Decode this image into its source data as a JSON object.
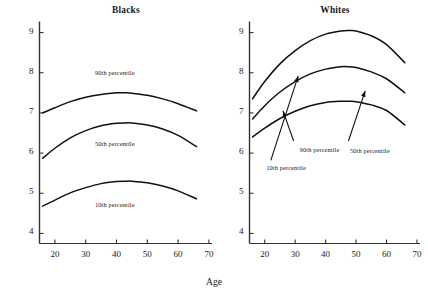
{
  "figure": {
    "xlabel": "Age",
    "ylabel": "Logarithm of regular-sector monthly earnings"
  },
  "chart_data": {
    "type": "line",
    "xlabel": "Age",
    "ylabel": "Logarithm of regular-sector monthly earnings",
    "xlim": [
      15,
      71
    ],
    "ylim": [
      3.75,
      9.25
    ],
    "xticks": [
      20,
      30,
      40,
      50,
      60,
      70
    ],
    "yticks": [
      4,
      5,
      6,
      7,
      8,
      9
    ],
    "grid": false,
    "legend": "inline-annotations",
    "panels": [
      {
        "name": "blacks",
        "title": "Blacks",
        "series": [
          {
            "name": "90th percentile",
            "label": "90th percentile",
            "label_x": 33,
            "label_y": 8.0,
            "arrow": false,
            "x": [
              16,
              20,
              25,
              30,
              35,
              40,
              43,
              45,
              50,
              55,
              60,
              66
            ],
            "y": [
              7.0,
              7.13,
              7.28,
              7.39,
              7.46,
              7.5,
              7.5,
              7.49,
              7.44,
              7.35,
              7.23,
              7.05
            ]
          },
          {
            "name": "50th percentile",
            "label": "50th percentile",
            "label_x": 33,
            "label_y": 6.22,
            "arrow": false,
            "x": [
              16,
              20,
              25,
              30,
              35,
              40,
              43,
              45,
              50,
              55,
              60,
              66
            ],
            "y": [
              5.87,
              6.12,
              6.38,
              6.56,
              6.68,
              6.74,
              6.75,
              6.75,
              6.7,
              6.6,
              6.44,
              6.16
            ]
          },
          {
            "name": "10th percentile",
            "label": "10th percentile",
            "label_x": 33,
            "label_y": 4.7,
            "arrow": false,
            "x": [
              16,
              20,
              25,
              30,
              35,
              40,
              43,
              45,
              50,
              55,
              60,
              66
            ],
            "y": [
              4.68,
              4.83,
              5.01,
              5.14,
              5.24,
              5.29,
              5.3,
              5.3,
              5.26,
              5.18,
              5.06,
              4.86
            ]
          }
        ]
      },
      {
        "name": "whites",
        "title": "Whites",
        "series": [
          {
            "name": "90th percentile",
            "label": "90th percentile",
            "label_x": 31.5,
            "label_y": 6.08,
            "arrow": true,
            "arrow_from_x": 29.5,
            "arrow_from_y": 6.3,
            "arrow_to_x": 26.0,
            "arrow_to_y": 7.05,
            "x": [
              16,
              20,
              25,
              30,
              35,
              40,
              45,
              48,
              50,
              55,
              60,
              66
            ],
            "y": [
              7.35,
              7.78,
              8.22,
              8.55,
              8.8,
              8.96,
              9.04,
              9.05,
              9.04,
              8.92,
              8.7,
              8.25
            ]
          },
          {
            "name": "50th percentile",
            "label": "50th percentile",
            "label_x": 48,
            "label_y": 6.05,
            "arrow": true,
            "arrow_from_x": 47.5,
            "arrow_from_y": 6.3,
            "arrow_to_x": 53.0,
            "arrow_to_y": 7.55,
            "x": [
              16,
              20,
              25,
              30,
              35,
              40,
              45,
              47,
              50,
              55,
              60,
              66
            ],
            "y": [
              6.85,
              7.18,
              7.52,
              7.78,
              7.97,
              8.09,
              8.15,
              8.15,
              8.13,
              8.02,
              7.85,
              7.5
            ]
          },
          {
            "name": "10th percentile",
            "label": "10th percentile",
            "label_x": 20.5,
            "label_y": 5.62,
            "arrow": true,
            "arrow_from_x": 22.0,
            "arrow_from_y": 5.82,
            "arrow_to_x": 31.0,
            "arrow_to_y": 7.92,
            "x": [
              16,
              20,
              25,
              30,
              35,
              40,
              45,
              48,
              50,
              55,
              60,
              66
            ],
            "y": [
              6.4,
              6.62,
              6.86,
              7.04,
              7.18,
              7.26,
              7.29,
              7.29,
              7.28,
              7.2,
              7.06,
              6.7
            ]
          }
        ]
      }
    ]
  }
}
